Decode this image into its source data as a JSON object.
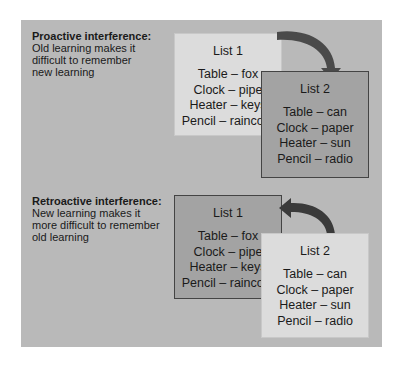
{
  "sections": [
    {
      "title": "Proactive interference:",
      "description": [
        "Old learning makes it",
        "difficult to remember",
        "new learning"
      ],
      "list1": {
        "label": "List 1",
        "pairs": [
          "Table – fox",
          "Clock – pipe",
          "Heater – keys",
          "Pencil – raincoat"
        ]
      },
      "list2": {
        "label": "List 2",
        "pairs": [
          "Table – can",
          "Clock – paper",
          "Heater – sun",
          "Pencil – radio"
        ]
      },
      "arrow_direction": "list1-to-list2"
    },
    {
      "title": "Retroactive interference:",
      "description": [
        "New learning makes it",
        "more difficult to remember",
        "old learning"
      ],
      "list1": {
        "label": "List 1",
        "pairs": [
          "Table – fox",
          "Clock – pipe",
          "Heater – keys",
          "Pencil – raincoat"
        ]
      },
      "list2": {
        "label": "List 2",
        "pairs": [
          "Table – can",
          "Clock – paper",
          "Heater – sun",
          "Pencil – radio"
        ]
      },
      "arrow_direction": "list2-to-list1"
    }
  ]
}
